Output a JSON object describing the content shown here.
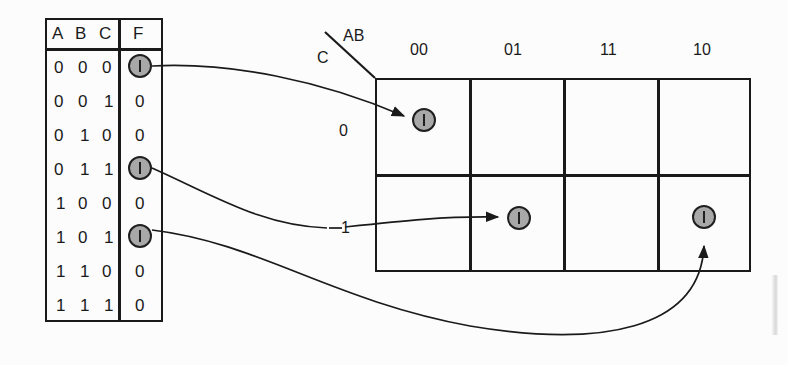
{
  "figure": {
    "background_color": "#fcfcfc",
    "ink_color": "#1a1a1a",
    "token_fill_color": "#a8a8a8",
    "token_symbol": "1"
  },
  "truth_table": {
    "headers": [
      "A",
      "B",
      "C",
      "F"
    ],
    "rows": [
      {
        "a": "0",
        "b": "0",
        "c": "0",
        "f": "1",
        "f_is_token": true
      },
      {
        "a": "0",
        "b": "0",
        "c": "1",
        "f": "0",
        "f_is_token": false
      },
      {
        "a": "0",
        "b": "1",
        "c": "0",
        "f": "0",
        "f_is_token": false
      },
      {
        "a": "0",
        "b": "1",
        "c": "1",
        "f": "1",
        "f_is_token": true
      },
      {
        "a": "1",
        "b": "0",
        "c": "0",
        "f": "0",
        "f_is_token": false
      },
      {
        "a": "1",
        "b": "0",
        "c": "1",
        "f": "1",
        "f_is_token": true
      },
      {
        "a": "1",
        "b": "1",
        "c": "0",
        "f": "0",
        "f_is_token": false
      },
      {
        "a": "1",
        "b": "1",
        "c": "1",
        "f": "0",
        "f_is_token": false
      }
    ]
  },
  "kmap": {
    "corner_label_top": "AB",
    "corner_label_bottom": "C",
    "column_headers": [
      "00",
      "01",
      "11",
      "10"
    ],
    "row_headers": [
      "0",
      "1"
    ],
    "cells": [
      {
        "row": "0",
        "col": "00",
        "value": "1",
        "has_token": true
      },
      {
        "row": "0",
        "col": "01",
        "value": "",
        "has_token": false
      },
      {
        "row": "0",
        "col": "11",
        "value": "",
        "has_token": false
      },
      {
        "row": "0",
        "col": "10",
        "value": "",
        "has_token": false
      },
      {
        "row": "1",
        "col": "00",
        "value": "",
        "has_token": false
      },
      {
        "row": "1",
        "col": "01",
        "value": "1",
        "has_token": true
      },
      {
        "row": "1",
        "col": "11",
        "value": "",
        "has_token": false
      },
      {
        "row": "1",
        "col": "10",
        "value": "1",
        "has_token": true
      }
    ]
  },
  "connectors": [
    {
      "name": "row-000-to-cell-C0-AB00",
      "from_row": "000",
      "to_cell": "C=0, AB=00"
    },
    {
      "name": "row-011-to-cell-C1-AB01",
      "from_row": "011",
      "to_cell": "C=1, AB=01"
    },
    {
      "name": "row-101-to-cell-C1-AB10",
      "from_row": "101",
      "to_cell": "C=1, AB=10"
    }
  ]
}
